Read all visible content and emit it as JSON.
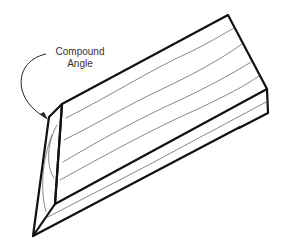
{
  "figure": {
    "annotation": {
      "line1": "Compound",
      "line2": "Angle"
    },
    "colors": {
      "outline": "#111111",
      "grain": "#555555",
      "text": "#333333",
      "background": "#ffffff"
    }
  }
}
